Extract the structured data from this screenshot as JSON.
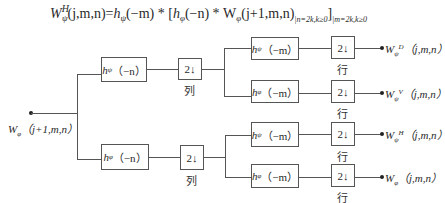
{
  "formula": {
    "lhs_main": "W",
    "lhs_sup": "H",
    "lhs_sub": "ψ",
    "lhs_args": "(j,m,n)",
    "eq": "=",
    "h1": "h",
    "h1_sub": "ψ",
    "h1_args": "(−m) * [",
    "h2": "h",
    "h2_sub": "φ",
    "h2_args": "(−n) * W",
    "w_sub": "φ",
    "w_args": "(j+1,m,n)",
    "cond1": "|n=2k,k≥0",
    "close": "]",
    "cond2": "|m=2k,k≥0"
  },
  "input": {
    "label_main": "W",
    "label_sub": "φ",
    "label_args": "（j+1,m,n）"
  },
  "stage1": {
    "top_filter": {
      "name": "h",
      "sub": "ψ",
      "args": "（−n）"
    },
    "bottom_filter": {
      "name": "h",
      "sub": "φ",
      "args": "（−n）"
    },
    "downsample_label": "2",
    "downsample_arrow": "↓",
    "caption": "列"
  },
  "stage2": {
    "filters": [
      {
        "name": "h",
        "sub": "ψ",
        "args": "（−m）"
      },
      {
        "name": "h",
        "sub": "φ",
        "args": "（−m）"
      },
      {
        "name": "h",
        "sub": "ψ",
        "args": "（−m）"
      },
      {
        "name": "h",
        "sub": "φ",
        "args": "（−m）"
      }
    ],
    "downsample_label": "2",
    "downsample_arrow": "↓",
    "caption": "行"
  },
  "outputs": [
    {
      "main": "W",
      "sub": "ψ",
      "sup": "D",
      "args": "（j,m,n）"
    },
    {
      "main": "W",
      "sub": "ψ",
      "sup": "V",
      "args": "（j,m,n）"
    },
    {
      "main": "W",
      "sub": "ψ",
      "sup": "H",
      "args": "（j,m,n）"
    },
    {
      "main": "W",
      "sub": "φ",
      "sup": "",
      "args": "（j,m,n）"
    }
  ]
}
